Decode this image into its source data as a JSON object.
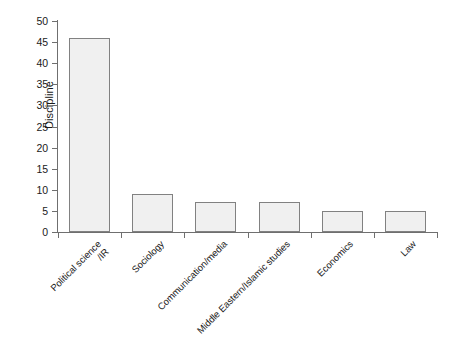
{
  "chart_data": {
    "type": "bar",
    "title": "",
    "subtitle": "",
    "xlabel": "",
    "ylabel": "Discipline",
    "categories": [
      "Political science\n/IR",
      "Sociology",
      "Communication/media",
      "Middle Eastern/Islamic studies",
      "Economics",
      "Law"
    ],
    "values": [
      46,
      9,
      7,
      7,
      5,
      5
    ],
    "ylim": [
      0,
      50
    ],
    "ytick_interval": 5,
    "yticks": [
      0,
      5,
      10,
      15,
      20,
      25,
      30,
      35,
      40,
      45,
      50
    ],
    "ytick_labels": [
      "0",
      "5",
      "10",
      "15",
      "20",
      "25",
      "30",
      "35",
      "40",
      "45",
      "50"
    ],
    "grid": false,
    "legend": false,
    "legend_position": "none",
    "bar_fill_color": "#f0f0f0",
    "bar_edge_color": "#818181",
    "axis_color": "#6f6f6f",
    "background_color": "#ffffff",
    "text_color": "#1a1a1a",
    "x_label_rotation": -45
  }
}
